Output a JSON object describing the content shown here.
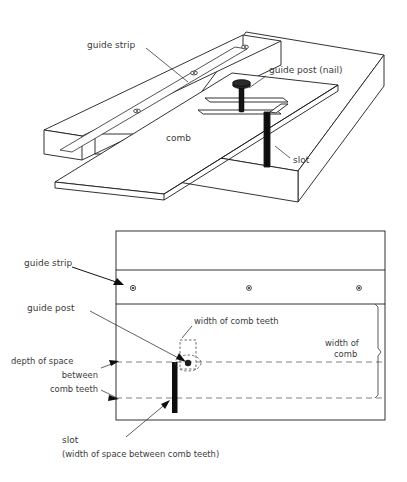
{
  "figure": {
    "domain_type": "technical-diagram",
    "line_color": "#1c1c1c",
    "accent_color": "#0d0d0d",
    "dashed_color": "#6d6d6d",
    "background": "#ffffff"
  },
  "top_view": {
    "name": "isometric-view",
    "labels": {
      "guide_strip": "guide strip",
      "guide_post_nail": "guide post (nail)",
      "comb": "comb",
      "slot": "slot"
    },
    "icons": {
      "nail": "nail-icon",
      "screw_hole": "screw-hole-icon"
    },
    "screw_hole_count": 3
  },
  "bottom_view": {
    "name": "plan-view",
    "labels": {
      "guide_strip": "guide strip",
      "guide_post": "guide post",
      "width_of_comb_teeth": "width of comb teeth",
      "width_of_comb_line1": "width of",
      "width_of_comb_line2": "comb",
      "depth_line1": "depth of space",
      "depth_line2": "between",
      "depth_line3": "comb teeth",
      "slot": "slot",
      "slot_sub": "(width of space between comb teeth)"
    },
    "icons": {
      "screw_hole": "screw-hole-icon",
      "guide_post_dot": "guide-post-dot-icon",
      "brace": "brace-icon"
    },
    "screw_hole_count": 3
  },
  "page_caption": {
    "text": ""
  }
}
